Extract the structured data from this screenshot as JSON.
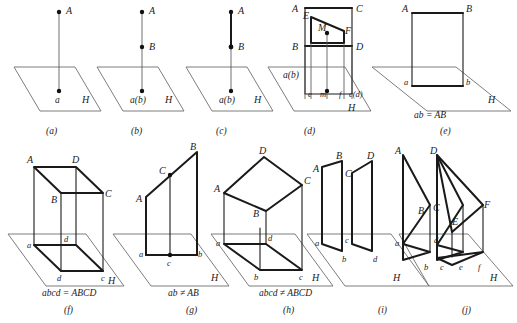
{
  "figure": {
    "title": "",
    "plane_label": "H",
    "stroke_color": "#1a1a1a",
    "light_stroke_color": "#6e6e6e"
  },
  "panels": [
    {
      "key": "a",
      "caption": "(a)",
      "equation": "",
      "plane": "H",
      "labels": [
        {
          "id": "A",
          "text": "A"
        },
        {
          "id": "a",
          "text": "a"
        }
      ]
    },
    {
      "key": "b",
      "caption": "(b)",
      "equation": "",
      "plane": "H",
      "labels": [
        {
          "id": "A",
          "text": "A"
        },
        {
          "id": "B",
          "text": "B"
        },
        {
          "id": "ab",
          "text": "a(b)"
        }
      ]
    },
    {
      "key": "c",
      "caption": "(c)",
      "equation": "",
      "plane": "H",
      "labels": [
        {
          "id": "A",
          "text": "A"
        },
        {
          "id": "B",
          "text": "B"
        },
        {
          "id": "ab",
          "text": "a(b)"
        }
      ]
    },
    {
      "key": "d",
      "caption": "(d)",
      "equation": "",
      "plane": "H",
      "labels": [
        {
          "id": "A",
          "text": "A"
        },
        {
          "id": "C",
          "text": "C"
        },
        {
          "id": "B",
          "text": "B"
        },
        {
          "id": "D",
          "text": "D"
        },
        {
          "id": "E",
          "text": "E"
        },
        {
          "id": "F",
          "text": "F"
        },
        {
          "id": "M",
          "text": "M"
        },
        {
          "id": "ab",
          "text": "a(b)"
        },
        {
          "id": "e",
          "text": "e"
        },
        {
          "id": "m",
          "text": "m"
        },
        {
          "id": "f",
          "text": "f"
        },
        {
          "id": "cd",
          "text": "c(d)"
        }
      ]
    },
    {
      "key": "e",
      "caption": "(e)",
      "equation": "ab = AB",
      "plane": "H",
      "labels": [
        {
          "id": "A",
          "text": "A"
        },
        {
          "id": "B",
          "text": "B"
        },
        {
          "id": "a",
          "text": "a"
        },
        {
          "id": "b",
          "text": "b"
        }
      ]
    },
    {
      "key": "f",
      "caption": "(f)",
      "equation": "abcd = ABCD",
      "plane": "H",
      "labels": [
        {
          "id": "A",
          "text": "A"
        },
        {
          "id": "D",
          "text": "D"
        },
        {
          "id": "B",
          "text": "B"
        },
        {
          "id": "C",
          "text": "C"
        },
        {
          "id": "a",
          "text": "a"
        },
        {
          "id": "d2",
          "text": "d"
        },
        {
          "id": "d",
          "text": "d"
        },
        {
          "id": "c",
          "text": "c"
        }
      ]
    },
    {
      "key": "g",
      "caption": "(g)",
      "equation": "ab ≠ AB",
      "plane": "H",
      "labels": [
        {
          "id": "B",
          "text": "B"
        },
        {
          "id": "C",
          "text": "C"
        },
        {
          "id": "A",
          "text": "A"
        },
        {
          "id": "a",
          "text": "a"
        },
        {
          "id": "c",
          "text": "c"
        },
        {
          "id": "b",
          "text": "b"
        }
      ]
    },
    {
      "key": "h",
      "caption": "(h)",
      "equation": "abcd ≠ ABCD",
      "plane": "H",
      "labels": [
        {
          "id": "D",
          "text": "D"
        },
        {
          "id": "C",
          "text": "C"
        },
        {
          "id": "A",
          "text": "A"
        },
        {
          "id": "B",
          "text": "B"
        },
        {
          "id": "a",
          "text": "a"
        },
        {
          "id": "d",
          "text": "d"
        },
        {
          "id": "b",
          "text": "b"
        },
        {
          "id": "c",
          "text": "c"
        }
      ]
    },
    {
      "key": "i",
      "caption": "(i)",
      "equation": "",
      "plane": "H",
      "labels": [
        {
          "id": "B",
          "text": "B"
        },
        {
          "id": "D",
          "text": "D"
        },
        {
          "id": "A",
          "text": "A"
        },
        {
          "id": "C",
          "text": "C"
        },
        {
          "id": "a",
          "text": "a"
        },
        {
          "id": "c",
          "text": "c"
        },
        {
          "id": "b",
          "text": "b"
        },
        {
          "id": "d",
          "text": "d"
        }
      ]
    },
    {
      "key": "j",
      "caption": "(j)",
      "equation": "",
      "plane": "H",
      "labels": [
        {
          "id": "A",
          "text": "A"
        },
        {
          "id": "D",
          "text": "D"
        },
        {
          "id": "B",
          "text": "B"
        },
        {
          "id": "C",
          "text": "C"
        },
        {
          "id": "E",
          "text": "E"
        },
        {
          "id": "F",
          "text": "F"
        },
        {
          "id": "a",
          "text": "a"
        },
        {
          "id": "d",
          "text": "d"
        },
        {
          "id": "b",
          "text": "b"
        },
        {
          "id": "c",
          "text": "c"
        },
        {
          "id": "e",
          "text": "e"
        },
        {
          "id": "f",
          "text": "f"
        }
      ]
    }
  ]
}
